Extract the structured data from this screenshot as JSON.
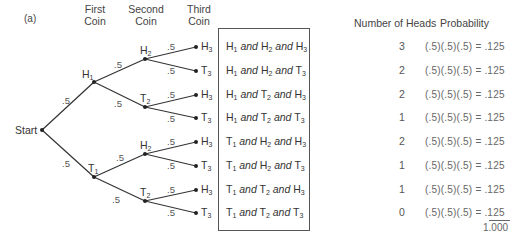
{
  "diagram": {
    "panel_label": "(a)",
    "headers": {
      "first_coin": [
        "First",
        "Coin"
      ],
      "second_coin": [
        "Second",
        "Coin"
      ],
      "third_coin": [
        "Third",
        "Coin"
      ],
      "number_of_heads": "Number of Heads",
      "probability": "Probability"
    },
    "start_label": "Start",
    "branch_probability": ".5",
    "nodes": {
      "first": [
        {
          "letter": "H",
          "sub": "1"
        },
        {
          "letter": "T",
          "sub": "1"
        }
      ],
      "second": [
        {
          "letter": "H",
          "sub": "2"
        },
        {
          "letter": "T",
          "sub": "2"
        },
        {
          "letter": "H",
          "sub": "2"
        },
        {
          "letter": "T",
          "sub": "2"
        }
      ],
      "third": [
        {
          "letter": "H",
          "sub": "3"
        },
        {
          "letter": "T",
          "sub": "3"
        },
        {
          "letter": "H",
          "sub": "3"
        },
        {
          "letter": "T",
          "sub": "3"
        },
        {
          "letter": "H",
          "sub": "3"
        },
        {
          "letter": "T",
          "sub": "3"
        },
        {
          "letter": "H",
          "sub": "3"
        },
        {
          "letter": "T",
          "sub": "3"
        }
      ]
    },
    "conjunction": "and",
    "outcomes": [
      {
        "c1": "H",
        "c2": "H",
        "c3": "H",
        "heads": "3",
        "probability": "(.5)(.5)(.5) = .125"
      },
      {
        "c1": "H",
        "c2": "H",
        "c3": "T",
        "heads": "2",
        "probability": "(.5)(.5)(.5) = .125"
      },
      {
        "c1": "H",
        "c2": "T",
        "c3": "H",
        "heads": "2",
        "probability": "(.5)(.5)(.5) = .125"
      },
      {
        "c1": "H",
        "c2": "T",
        "c3": "T",
        "heads": "1",
        "probability": "(.5)(.5)(.5) = .125"
      },
      {
        "c1": "T",
        "c2": "H",
        "c3": "H",
        "heads": "2",
        "probability": "(.5)(.5)(.5) = .125"
      },
      {
        "c1": "T",
        "c2": "H",
        "c3": "T",
        "heads": "1",
        "probability": "(.5)(.5)(.5) = .125"
      },
      {
        "c1": "T",
        "c2": "T",
        "c3": "H",
        "heads": "1",
        "probability": "(.5)(.5)(.5) = .125"
      },
      {
        "c1": "T",
        "c2": "T",
        "c3": "T",
        "heads": "0",
        "probability": "(.5)(.5)(.5) = .125"
      }
    ],
    "total": "1.000"
  }
}
